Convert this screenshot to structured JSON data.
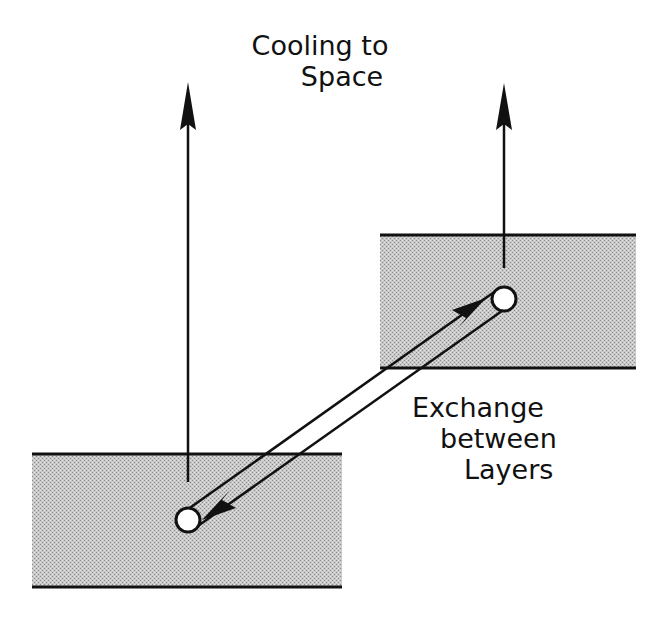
{
  "diagram": {
    "labels": {
      "cooling_line1": "Cooling to",
      "cooling_line2": "Space",
      "exchange_line1": "Exchange",
      "exchange_line2": "between",
      "exchange_line3": "Layers"
    },
    "layers": [
      {
        "name": "upper-layer",
        "x": 380,
        "y": 235,
        "width": 256,
        "height": 133
      },
      {
        "name": "lower-layer",
        "x": 32,
        "y": 454,
        "width": 310,
        "height": 133
      }
    ],
    "nodes": [
      {
        "name": "upper-node",
        "cx": 504,
        "cy": 299,
        "r": 12
      },
      {
        "name": "lower-node",
        "cx": 188,
        "cy": 520,
        "r": 12
      }
    ],
    "arrows": [
      {
        "name": "cooling-arrow-lower",
        "x": 188,
        "y_from": 482,
        "y_to": 82
      },
      {
        "name": "cooling-arrow-upper",
        "x": 504,
        "y_from": 268,
        "y_to": 83
      }
    ],
    "colors": {
      "line": "#111111",
      "fill": "#b9b9b9",
      "background": "#ffffff"
    }
  }
}
